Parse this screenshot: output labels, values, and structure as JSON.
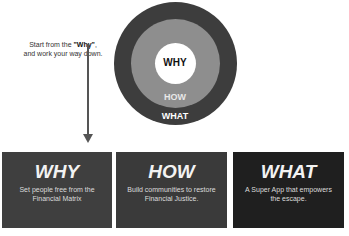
{
  "note": {
    "line1_prefix": "Start from the ",
    "line1_emphasis": "\"Why\"",
    "line1_suffix": ",",
    "line2": "and work your way down."
  },
  "circle": {
    "inner_label": "WHY",
    "middle_label": "HOW",
    "outer_label": "WHAT",
    "colors": {
      "inner": "#ffffff",
      "middle": "#8e8e8e",
      "outer": "#3d3d3d"
    }
  },
  "boxes": [
    {
      "title": "WHY",
      "description": "Set people free from the Financial Matrix",
      "color": "#3f3f3f"
    },
    {
      "title": "HOW",
      "description": "Build communities to restore Financial Justice.",
      "color": "#3a3a3a"
    },
    {
      "title": "WHAT",
      "description": "A Super App that empowers the escape.",
      "color": "#1f1f1f"
    }
  ]
}
